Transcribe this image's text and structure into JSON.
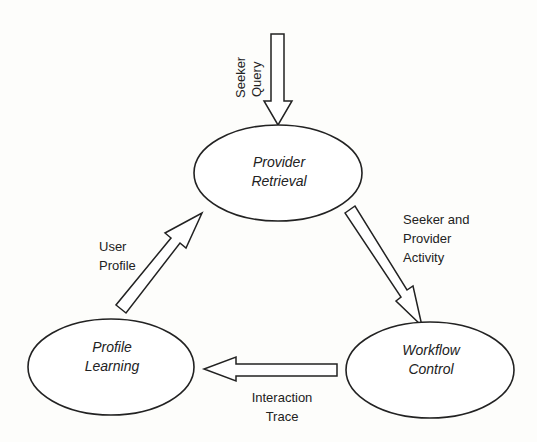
{
  "nodes": {
    "provider_retrieval": {
      "line1": "Provider",
      "line2": "Retrieval"
    },
    "workflow_control": {
      "line1": "Workflow",
      "line2": "Control"
    },
    "profile_learning": {
      "line1": "Profile",
      "line2": "Learning"
    }
  },
  "edges": {
    "seeker_query": {
      "line1": "Seeker",
      "line2": "Query"
    },
    "seeker_provider_activity": {
      "line1": "Seeker and",
      "line2": "Provider",
      "line3": "Activity"
    },
    "interaction_trace": {
      "line1": "Interaction",
      "line2": "Trace"
    },
    "user_profile": {
      "line1": "User",
      "line2": "Profile"
    }
  }
}
